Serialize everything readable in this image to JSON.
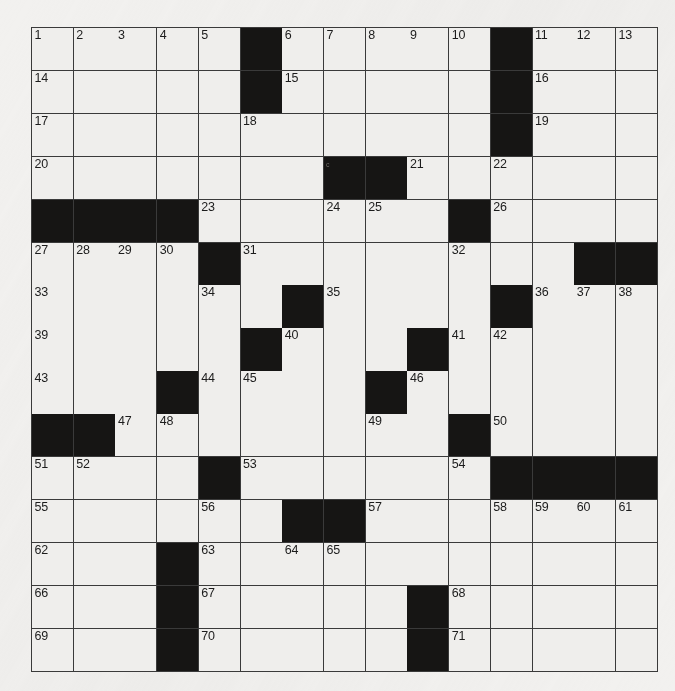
{
  "puzzle": {
    "type": "crossword-grid",
    "rows": 15,
    "columns": 15,
    "colors": {
      "paper": "#f2f1ef",
      "cell_fill": "#efeeec",
      "block_fill": "#161514",
      "grid_line": "#3a3a3a",
      "number_text": "#1c1c1c"
    },
    "highest_clue_number": 71,
    "grid": [
      [
        "1",
        "2",
        "3",
        "4",
        "5",
        "#",
        "6",
        "7",
        "8",
        "9",
        "10",
        "#",
        "11",
        "12",
        "13"
      ],
      [
        "14",
        "",
        "",
        "",
        "",
        "#",
        "15",
        "",
        "",
        "",
        "",
        "#",
        "16",
        "",
        ""
      ],
      [
        "17",
        "",
        "",
        "",
        "",
        "18",
        "",
        "",
        "",
        "",
        "",
        "#",
        "19",
        "",
        ""
      ],
      [
        "20",
        "",
        "",
        "",
        "",
        "",
        "",
        "#c",
        "#",
        "21",
        "",
        "22",
        "",
        "",
        ""
      ],
      [
        "#",
        "#",
        "#",
        "#",
        "23",
        "",
        "",
        "24",
        "25",
        "",
        "#",
        "26",
        "",
        "",
        ""
      ],
      [
        "27",
        "28",
        "29",
        "30",
        "#",
        "31",
        "",
        "",
        "",
        "",
        "32",
        "",
        "",
        "#",
        "#"
      ],
      [
        "33",
        "",
        "",
        "",
        "34",
        "",
        "#",
        "35",
        "",
        "",
        "",
        "#",
        "36",
        "37",
        "38"
      ],
      [
        "39",
        "",
        "",
        "",
        "",
        "#",
        "40",
        "",
        "",
        "#",
        "41",
        "42",
        "",
        "",
        ""
      ],
      [
        "43",
        "",
        "",
        "#",
        "44",
        "45",
        "",
        "",
        "#",
        "46",
        "",
        "",
        "",
        "",
        ""
      ],
      [
        "#",
        "#",
        "47",
        "48",
        "",
        "",
        "",
        "",
        "49",
        "",
        "#",
        "50",
        "",
        "",
        ""
      ],
      [
        "51",
        "52",
        "",
        "",
        "#",
        "53",
        "",
        "",
        "",
        "",
        "54",
        "#",
        "#",
        "#",
        "#"
      ],
      [
        "55",
        "",
        "",
        "",
        "56",
        "",
        "#",
        "#",
        "57",
        "",
        "",
        "58",
        "59",
        "60",
        "61"
      ],
      [
        "62",
        "",
        "",
        "#",
        "63",
        "",
        "64",
        "65",
        "",
        "",
        "",
        "",
        "",
        "",
        ""
      ],
      [
        "66",
        "",
        "",
        "#",
        "67",
        "",
        "",
        "",
        "",
        "#",
        "68",
        "",
        "",
        "",
        ""
      ],
      [
        "69",
        "",
        "",
        "#",
        "70",
        "",
        "",
        "",
        "",
        "#",
        "71",
        "",
        "",
        "",
        ""
      ]
    ],
    "across_numbers": [
      1,
      6,
      11,
      14,
      15,
      16,
      17,
      19,
      20,
      21,
      22,
      23,
      24,
      26,
      27,
      31,
      32,
      33,
      35,
      36,
      39,
      40,
      41,
      43,
      44,
      46,
      47,
      49,
      50,
      51,
      53,
      54,
      55,
      57,
      58,
      62,
      63,
      66,
      67,
      68,
      69,
      70,
      71
    ],
    "down_numbers": [
      1,
      2,
      3,
      4,
      5,
      6,
      7,
      8,
      9,
      10,
      11,
      12,
      13,
      18,
      21,
      25,
      27,
      28,
      29,
      30,
      34,
      37,
      38,
      42,
      45,
      48,
      52,
      56,
      59,
      60,
      61,
      64,
      65
    ]
  }
}
